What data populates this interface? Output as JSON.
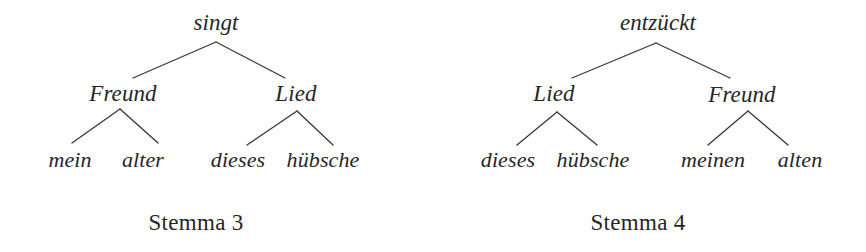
{
  "figure": {
    "background_color": "#ffffff",
    "ink_color": "#262626",
    "line_color": "#3a3a3a"
  },
  "stemmas": [
    {
      "caption": "Stemma 3",
      "caption_pos": {
        "x": 196,
        "y": 222
      },
      "nodes": [
        {
          "id": "s3-root",
          "label": "singt",
          "level": "root",
          "x": 216,
          "y": 22
        },
        {
          "id": "s3-b1",
          "label": "Freund",
          "level": "branch",
          "x": 123,
          "y": 93
        },
        {
          "id": "s3-b2",
          "label": "Lied",
          "level": "branch",
          "x": 296,
          "y": 93
        },
        {
          "id": "s3-l1",
          "label": "mein",
          "level": "leaf",
          "x": 70,
          "y": 160
        },
        {
          "id": "s3-l2",
          "label": "alter",
          "level": "leaf",
          "x": 143,
          "y": 160
        },
        {
          "id": "s3-l3",
          "label": "dieses",
          "level": "leaf",
          "x": 238,
          "y": 160
        },
        {
          "id": "s3-l4",
          "label": "hübsche",
          "level": "leaf",
          "x": 323,
          "y": 160
        }
      ],
      "edges": [
        {
          "from": "s3-root",
          "to": "s3-b1",
          "x1": 216,
          "y1": 42,
          "x2": 133,
          "y2": 78
        },
        {
          "from": "s3-root",
          "to": "s3-b2",
          "x1": 216,
          "y1": 42,
          "x2": 285,
          "y2": 78
        },
        {
          "from": "s3-b1",
          "to": "s3-l1",
          "x1": 120,
          "y1": 109,
          "x2": 72,
          "y2": 143
        },
        {
          "from": "s3-b1",
          "to": "s3-l2",
          "x1": 120,
          "y1": 109,
          "x2": 158,
          "y2": 143
        },
        {
          "from": "s3-b2",
          "to": "s3-l3",
          "x1": 297,
          "y1": 111,
          "x2": 247,
          "y2": 145
        },
        {
          "from": "s3-b2",
          "to": "s3-l4",
          "x1": 297,
          "y1": 111,
          "x2": 333,
          "y2": 145
        }
      ]
    },
    {
      "caption": "Stemma 4",
      "caption_pos": {
        "x": 638,
        "y": 222
      },
      "nodes": [
        {
          "id": "s4-root",
          "label": "entzückt",
          "level": "root",
          "x": 658,
          "y": 22
        },
        {
          "id": "s4-b1",
          "label": "Lied",
          "level": "branch",
          "x": 554,
          "y": 93
        },
        {
          "id": "s4-b2",
          "label": "Freund",
          "level": "branch",
          "x": 742,
          "y": 94
        },
        {
          "id": "s4-l1",
          "label": "dieses",
          "level": "leaf",
          "x": 508,
          "y": 160
        },
        {
          "id": "s4-l2",
          "label": "hübsche",
          "level": "leaf",
          "x": 593,
          "y": 160
        },
        {
          "id": "s4-l3",
          "label": "meinen",
          "level": "leaf",
          "x": 713,
          "y": 160
        },
        {
          "id": "s4-l4",
          "label": "alten",
          "level": "leaf",
          "x": 800,
          "y": 160
        }
      ],
      "edges": [
        {
          "from": "s4-root",
          "to": "s4-b1",
          "x1": 656,
          "y1": 43,
          "x2": 572,
          "y2": 78
        },
        {
          "from": "s4-root",
          "to": "s4-b2",
          "x1": 656,
          "y1": 43,
          "x2": 730,
          "y2": 78
        },
        {
          "from": "s4-b1",
          "to": "s4-l1",
          "x1": 557,
          "y1": 112,
          "x2": 517,
          "y2": 145
        },
        {
          "from": "s4-b1",
          "to": "s4-l2",
          "x1": 557,
          "y1": 112,
          "x2": 597,
          "y2": 145
        },
        {
          "from": "s4-b2",
          "to": "s4-l3",
          "x1": 748,
          "y1": 111,
          "x2": 708,
          "y2": 145
        },
        {
          "from": "s4-b2",
          "to": "s4-l4",
          "x1": 748,
          "y1": 111,
          "x2": 788,
          "y2": 145
        }
      ]
    }
  ]
}
